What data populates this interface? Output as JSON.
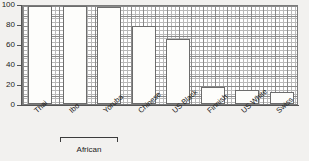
{
  "chart_data": {
    "type": "bar",
    "title": "",
    "subtitle": "",
    "xlabel": "",
    "ylabel": "",
    "categories": [
      "Thai",
      "Ibo",
      "Yoruba",
      "Chinese",
      "US Black",
      "Finnish",
      "US White",
      "Swiss"
    ],
    "values": [
      98,
      98,
      97,
      78,
      65,
      17,
      14,
      12
    ],
    "ylim": [
      0,
      100
    ],
    "xlim_note": "categorical",
    "yticks": [
      0,
      20,
      40,
      60,
      80,
      100
    ],
    "ytick_labels": [
      "0",
      "20",
      "40",
      "60",
      "80",
      "100"
    ],
    "grid": true,
    "grid_style": "fine mesh, minor and major lines",
    "legend": false,
    "legend_position": "none",
    "annotations": [
      {
        "text": "African",
        "type": "group-bracket",
        "covers": [
          "Ibo",
          "Yoruba"
        ]
      }
    ],
    "bar_fill_color": "#fdfdfb",
    "bar_edge_color": "#6d6d6d",
    "plot_background_color": "#ffffff",
    "figure_background_color": "#f2f1ef",
    "grid_minor_color": "#b9b9b9",
    "grid_major_color": "#8a8a8a",
    "axis_color": "#555555",
    "text_color": "#1c1c1c",
    "category_label_rotation_deg": -42
  }
}
